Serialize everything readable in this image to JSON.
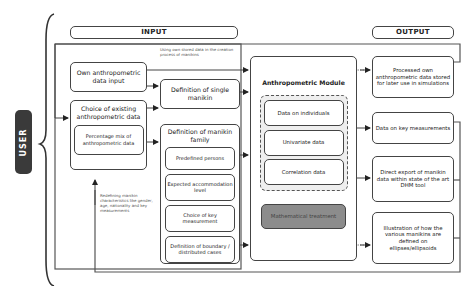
{
  "user_label": "USER",
  "headers": {
    "input": "INPUT",
    "output": "OUTPUT"
  },
  "annotations": {
    "top": "Using own stored data in the creation process of manikins",
    "bottom": "Redefining manikin characteristics like gender, age, nationality and key measurements"
  },
  "input": {
    "own_data": "Own anthropometric data input",
    "choice_existing": "Choice of existing anthropometric data",
    "percentage_mix": "Percentage mix of anthropometric data"
  },
  "definition": {
    "single": "Definition of single manikin",
    "family": "Definition of manikin family",
    "family_items": [
      "Predefined persons",
      "Expected accommodation level",
      "Choice of key measurement",
      "Definition of boundary / distributed cases"
    ]
  },
  "module": {
    "title": "Anthropometric Module",
    "data_items": [
      "Data on individuals",
      "Univariate data",
      "Correlation data"
    ],
    "math": "Mathematical treatment"
  },
  "output": {
    "items": [
      "Processed own anthropometric data stored for later use in simulations",
      "Data on key measurements",
      "Direct export of manikin data within state of the art DHM tool",
      "Illustration of how the various manikins are defined on ellipses/ellipsoids"
    ]
  },
  "colors": {
    "line": "#444444",
    "math_fill": "#8c8c8c",
    "user_fill": "#3a3a3a"
  }
}
